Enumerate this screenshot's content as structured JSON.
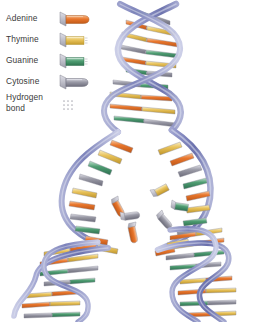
{
  "figure": {
    "background": "#ffffff",
    "width": 261,
    "height": 322
  },
  "legend": {
    "items": [
      {
        "label": "Adenine",
        "icon": "adenine-nucleotide-icon",
        "color": "#e8762c",
        "light": "#f6b98a",
        "dark": "#c25a18"
      },
      {
        "label": "Thymine",
        "icon": "thymine-nucleotide-icon",
        "color": "#e8c25a",
        "light": "#f6e2a8",
        "dark": "#c49b2c"
      },
      {
        "label": "Guanine",
        "icon": "guanine-nucleotide-icon",
        "color": "#4f9d72",
        "light": "#a6d2ba",
        "dark": "#2f7550"
      },
      {
        "label": "Cytosine",
        "icon": "cytosine-nucleotide-icon",
        "color": "#9a9aa6",
        "light": "#cacad4",
        "dark": "#6e6e7c"
      },
      {
        "label": "Hydrogen bond",
        "label_line1": "Hydrogen",
        "label_line2": "bond",
        "icon": "hydrogen-bond-dots-icon",
        "color": "#b6b6bd",
        "light": "#d8d8de",
        "dark": "#9a9aa2"
      }
    ]
  },
  "colors": {
    "backbone": "#8f93c4",
    "backbone_light": "#c5c8e2",
    "backbone_dark": "#5d629c",
    "backbone_edge": "#6f74ad",
    "adenine": "#e8762c",
    "thymine": "#e8c25a",
    "guanine": "#4f9d72",
    "cytosine": "#9a9aa6",
    "hydrogen_bond": "#b0b0b8",
    "outline": "#7a7a86",
    "sugar": "#b9b9c4"
  },
  "structure": {
    "top_helix": {
      "name": "parent-double-helix",
      "turns": 3,
      "label": "Intact parent double helix"
    },
    "replication_bubble": {
      "name": "replication-bubble",
      "label": "Unwound replication bubble",
      "free_nucleotide_count": 6
    },
    "daughter_left": {
      "name": "daughter-helix-left",
      "turns": 2,
      "label": "Daughter double helix (left)"
    },
    "daughter_right": {
      "name": "daughter-helix-right",
      "turns": 2,
      "label": "Daughter double helix (right)"
    }
  },
  "base_sequence": {
    "top_helix": [
      "guanine",
      "cytosine",
      "adenine",
      "thymine",
      "cytosine",
      "guanine",
      "thymine",
      "adenine",
      "adenine",
      "thymine"
    ],
    "bubble_left": [
      "adenine",
      "thymine",
      "guanine",
      "cytosine",
      "thymine",
      "adenine",
      "cytosine",
      "guanine",
      "adenine",
      "thymine",
      "thymine",
      "guanine"
    ],
    "bubble_right": [
      "thymine",
      "adenine",
      "cytosine",
      "guanine",
      "adenine",
      "thymine",
      "guanine",
      "cytosine",
      "thymine",
      "adenine",
      "adenine",
      "cytosine"
    ],
    "daughter_left": [
      "thymine",
      "adenine",
      "guanine",
      "cytosine",
      "adenine",
      "thymine",
      "cytosine",
      "guanine",
      "thymine",
      "adenine"
    ],
    "daughter_right": [
      "adenine",
      "thymine",
      "cytosine",
      "guanine",
      "thymine",
      "adenine",
      "guanine",
      "cytosine",
      "adenine",
      "thymine"
    ]
  },
  "free_nucleotides": [
    {
      "base": "adenine",
      "x": 118,
      "y": 198,
      "rot": 25
    },
    {
      "base": "thymine",
      "x": 152,
      "y": 192,
      "rot": -35
    },
    {
      "base": "guanine",
      "x": 170,
      "y": 203,
      "rot": 15
    },
    {
      "base": "cytosine",
      "x": 122,
      "y": 213,
      "rot": -15
    },
    {
      "base": "cytosine",
      "x": 163,
      "y": 212,
      "rot": 55
    },
    {
      "base": "adenine",
      "x": 140,
      "y": 220,
      "rot": 70
    }
  ]
}
